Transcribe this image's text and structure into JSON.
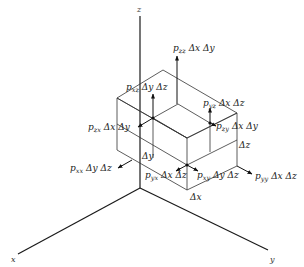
{
  "diagram": {
    "axes": {
      "x": "x",
      "y": "y",
      "z": "z"
    },
    "dimensions": {
      "dx": "Δx",
      "dy": "Δy",
      "dz": "Δz"
    },
    "forces": {
      "pzz": {
        "p": "p",
        "sub": "zz",
        "area": "Δx Δy"
      },
      "pxz": {
        "p": "p",
        "sub": "xz",
        "area": "Δy Δz"
      },
      "pyz": {
        "p": "p",
        "sub": "yz",
        "area": "Δx Δz"
      },
      "pzy": {
        "p": "p",
        "sub": "zy",
        "area": "Δx Δy"
      },
      "pzx": {
        "p": "p",
        "sub": "zx",
        "area": "Δx Δy"
      },
      "pxx": {
        "p": "p",
        "sub": "xx",
        "area": "Δy Δz"
      },
      "pyx": {
        "p": "p",
        "sub": "yx",
        "area": "Δx Δz"
      },
      "pxy": {
        "p": "p",
        "sub": "xy",
        "area": "Δy Δz"
      },
      "pyy": {
        "p": "p",
        "sub": "yy",
        "area": "Δx Δz"
      }
    },
    "colors": {
      "line": "#1a1a1a",
      "background": "#ffffff"
    }
  }
}
